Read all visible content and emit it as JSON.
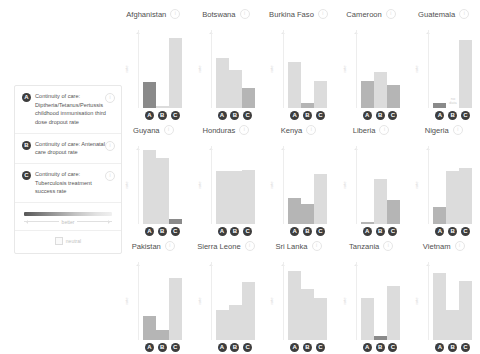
{
  "legend": {
    "entries": [
      {
        "badge": "A",
        "text": "Continuity of care: Diptheria/Tetanus/Pertussis childhood immunisation third dose dropout rate",
        "info": "i"
      },
      {
        "badge": "B",
        "text": "Continuity of care: Antenatal care dropout rate",
        "info": "i"
      },
      {
        "badge": "C",
        "text": "Continuity of care: Tuberculosis treatment success rate",
        "info": "i"
      }
    ],
    "scale_label": "better",
    "neutral_label": "neutral"
  },
  "axis": {
    "label": "rate"
  },
  "no_data_text": "no data",
  "colors": {
    "dark": "#8a8a8a",
    "mid": "#b5b5b5",
    "light": "#dcdcdc",
    "badge": "#3d3d3d"
  },
  "chart_data": {
    "type": "bar",
    "categories": [
      "A",
      "B",
      "C"
    ],
    "xlabel": "",
    "ylabel": "rate",
    "ylim": [
      0,
      100
    ],
    "grid": false,
    "legend_position": "left",
    "panels": [
      {
        "country": "Afghanistan",
        "values": [
          33,
          2,
          88
        ],
        "shades": [
          "dark",
          "light",
          "light"
        ],
        "no_data": [
          false,
          false,
          false
        ]
      },
      {
        "country": "Botswana",
        "values": [
          62,
          47,
          25
        ],
        "shades": [
          "light",
          "light",
          "mid"
        ],
        "no_data": [
          false,
          false,
          false
        ]
      },
      {
        "country": "Burkina Faso",
        "values": [
          58,
          6,
          34
        ],
        "shades": [
          "light",
          "mid",
          "light"
        ],
        "no_data": [
          false,
          false,
          false
        ]
      },
      {
        "country": "Cameroon",
        "values": [
          34,
          45,
          29
        ],
        "shades": [
          "mid",
          "light",
          "mid"
        ],
        "no_data": [
          false,
          false,
          false
        ]
      },
      {
        "country": "Guatemala",
        "values": [
          6,
          0,
          85
        ],
        "shades": [
          "dark",
          "light",
          "light"
        ],
        "no_data": [
          false,
          true,
          false
        ]
      },
      {
        "country": "Guyana",
        "values": [
          92,
          83,
          6
        ],
        "shades": [
          "light",
          "light",
          "dark"
        ],
        "no_data": [
          false,
          false,
          false
        ]
      },
      {
        "country": "Honduras",
        "values": [
          66,
          66,
          68
        ],
        "shades": [
          "light",
          "light",
          "light"
        ],
        "no_data": [
          false,
          false,
          false
        ]
      },
      {
        "country": "Kenya",
        "values": [
          32,
          25,
          63
        ],
        "shades": [
          "mid",
          "mid",
          "light"
        ],
        "no_data": [
          false,
          false,
          false
        ]
      },
      {
        "country": "Liberia",
        "values": [
          3,
          56,
          30
        ],
        "shades": [
          "mid",
          "light",
          "mid"
        ],
        "no_data": [
          false,
          false,
          false
        ]
      },
      {
        "country": "Nigeria",
        "values": [
          21,
          66,
          70
        ],
        "shades": [
          "mid",
          "light",
          "light"
        ],
        "no_data": [
          false,
          false,
          false
        ]
      },
      {
        "country": "Pakistan",
        "values": [
          30,
          13,
          78
        ],
        "shades": [
          "mid",
          "mid",
          "light"
        ],
        "no_data": [
          false,
          false,
          false
        ]
      },
      {
        "country": "Sierra Leone",
        "values": [
          37,
          44,
          72
        ],
        "shades": [
          "light",
          "light",
          "light"
        ],
        "no_data": [
          false,
          false,
          false
        ]
      },
      {
        "country": "Sri Lanka",
        "values": [
          86,
          64,
          52
        ],
        "shades": [
          "light",
          "light",
          "light"
        ],
        "no_data": [
          false,
          false,
          false
        ]
      },
      {
        "country": "Tanzania",
        "values": [
          52,
          5,
          68
        ],
        "shades": [
          "light",
          "dark",
          "light"
        ],
        "no_data": [
          false,
          false,
          false
        ]
      },
      {
        "country": "Vietnam",
        "values": [
          84,
          38,
          74
        ],
        "shades": [
          "light",
          "light",
          "light"
        ],
        "no_data": [
          false,
          false,
          false
        ]
      }
    ]
  }
}
